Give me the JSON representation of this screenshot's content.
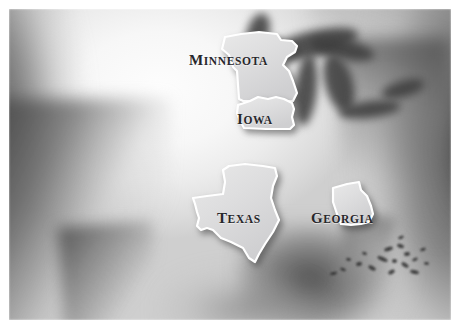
{
  "map": {
    "title": "United States map with four highlighted states",
    "region": "United States of America",
    "style": "blurred grayscale relief map",
    "frame_color": "#ffffff",
    "land_color": "#f2f2f2",
    "ocean_color": "#5c5c5c",
    "state_fill": "#e2e2e2",
    "state_outline": "#ffffff",
    "label_color": "#27272b",
    "highlighted_states": [
      {
        "name": "Minnesota",
        "label_first": "M",
        "label_rest": "INNESOTA",
        "label_x": 180,
        "label_y": 42
      },
      {
        "name": "Iowa",
        "label_first": "I",
        "label_rest": "OWA",
        "label_x": 228,
        "label_y": 101
      },
      {
        "name": "Texas",
        "label_first": "T",
        "label_rest": "EXAS",
        "label_x": 208,
        "label_y": 200
      },
      {
        "name": "Georgia",
        "label_first": "G",
        "label_rest": "EORGIA",
        "label_x": 302,
        "label_y": 200
      }
    ],
    "features": [
      "Great Lakes",
      "Pacific Ocean",
      "Atlantic Ocean",
      "Gulf of Mexico",
      "Florida peninsula",
      "Baja California",
      "Caribbean islands"
    ],
    "islands": [
      {
        "x": 384,
        "y": 247,
        "w": 9,
        "h": 4,
        "r": -18
      },
      {
        "x": 397,
        "y": 244,
        "w": 7,
        "h": 4,
        "r": 20
      },
      {
        "x": 404,
        "y": 252,
        "w": 6,
        "h": 4,
        "r": -8
      },
      {
        "x": 377,
        "y": 257,
        "w": 11,
        "h": 4,
        "r": 24
      },
      {
        "x": 392,
        "y": 259,
        "w": 5,
        "h": 4,
        "r": 0
      },
      {
        "x": 401,
        "y": 263,
        "w": 8,
        "h": 4,
        "r": 34
      },
      {
        "x": 412,
        "y": 258,
        "w": 6,
        "h": 3,
        "r": -26
      },
      {
        "x": 368,
        "y": 266,
        "w": 8,
        "h": 4,
        "r": 30
      },
      {
        "x": 356,
        "y": 262,
        "w": 6,
        "h": 4,
        "r": -14
      },
      {
        "x": 346,
        "y": 258,
        "w": 5,
        "h": 3,
        "r": 10
      },
      {
        "x": 388,
        "y": 270,
        "w": 7,
        "h": 4,
        "r": -30
      },
      {
        "x": 410,
        "y": 270,
        "w": 9,
        "h": 4,
        "r": 12
      },
      {
        "x": 420,
        "y": 248,
        "w": 6,
        "h": 3,
        "r": -20
      },
      {
        "x": 362,
        "y": 252,
        "w": 5,
        "h": 3,
        "r": 18
      },
      {
        "x": 340,
        "y": 268,
        "w": 6,
        "h": 3,
        "r": 22
      },
      {
        "x": 330,
        "y": 272,
        "w": 7,
        "h": 3,
        "r": -12
      },
      {
        "x": 424,
        "y": 262,
        "w": 5,
        "h": 3,
        "r": 8
      },
      {
        "x": 398,
        "y": 236,
        "w": 6,
        "h": 3,
        "r": -24
      }
    ],
    "state_paths": {
      "minnesota": "M 3 18 L 6 6 L 22 3 L 40 1 L 58 3 L 62 9 L 73 10 L 78 15 L 76 21 L 68 26 L 64 34 L 70 40 L 74 50 L 78 62 L 74 70 L 60 70 L 24 70 L 20 68 L 18 40 L 14 36 L 10 24 Z",
      "iowa": "M 2 10 L 14 6 L 22 2 L 32 4 L 40 2 L 48 4 L 56 8 L 58 14 L 56 22 L 58 30 L 54 34 L 30 34 L 8 33 L 4 26 L 1 18 Z",
      "texas": "M 28 42 L 26 36 L 40 34 L 56 32 L 58 20 L 56 8 L 62 4 L 78 2 L 96 4 L 108 6 L 110 14 L 106 24 L 104 36 L 108 48 L 112 58 L 106 70 L 98 82 L 92 92 L 88 100 L 82 96 L 76 86 L 64 80 L 54 76 L 46 68 L 40 66 L 34 68 L 30 64 L 32 56 L 30 50 Z",
      "georgia": "M 6 8 L 20 4 L 32 2 L 34 10 L 40 16 L 44 26 L 46 34 L 42 42 L 34 44 L 24 45 L 14 44 L 10 34 L 6 22 Z"
    }
  }
}
